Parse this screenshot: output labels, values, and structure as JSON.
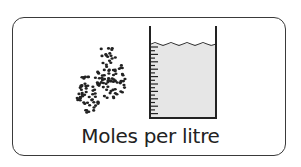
{
  "card": {
    "caption": "Moles per litre"
  },
  "illustration": {
    "particles": "particle-cluster",
    "container": "beaker-with-liquid",
    "liquid_color": "#e4e4e4",
    "outline_color": "#222222"
  }
}
